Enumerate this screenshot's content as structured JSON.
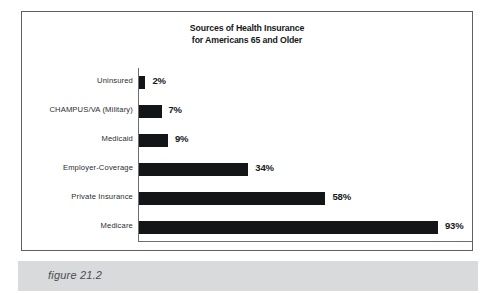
{
  "figure": {
    "caption": "figure 21.2"
  },
  "chart_data": {
    "type": "bar",
    "orientation": "horizontal",
    "title": "Sources of Health Insurance for Americans 65 and Older",
    "title_lines": [
      "Sources of Health Insurance",
      "for Americans 65 and Older"
    ],
    "xlabel": "",
    "ylabel": "",
    "xlim": [
      0,
      100
    ],
    "grid": false,
    "legend": false,
    "unit": "%",
    "bar_color": "#131517",
    "categories": [
      "Uninsured",
      "CHAMPUS/VA (Military)",
      "Medicaid",
      "Employer-Coverage",
      "Private Insurance",
      "Medicare"
    ],
    "values": [
      2,
      7,
      9,
      34,
      58,
      93
    ],
    "value_labels": [
      "2%",
      "7%",
      "9%",
      "34%",
      "58%",
      "93%"
    ]
  }
}
